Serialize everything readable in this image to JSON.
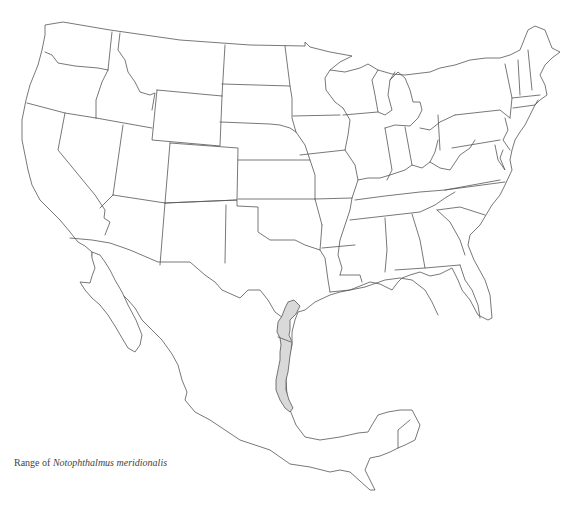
{
  "map": {
    "region": "Contiguous United States and Mexico",
    "caption": {
      "prefix": "Range of ",
      "species": "Notophthalmus meridionalis"
    },
    "range_fill_color": "#d9d9d9",
    "border_color": "#555555",
    "background_color": "#ffffff"
  }
}
